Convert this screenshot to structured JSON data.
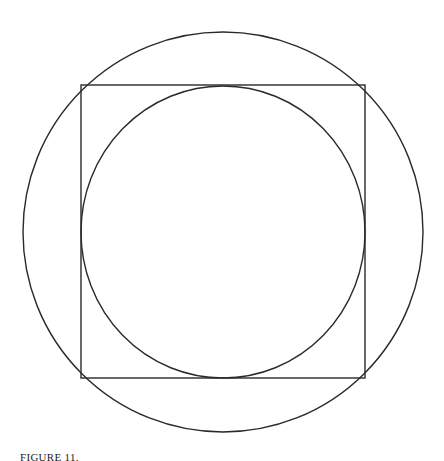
{
  "figure": {
    "type": "geometric-construction",
    "stroke_color": "#2a2a2a",
    "background": "#ffffff",
    "outer_circle": {
      "cx": 223,
      "cy": 232,
      "r": 200
    },
    "square": {
      "x": 81,
      "y": 85,
      "width": 284,
      "height": 293
    },
    "inner_circle": {
      "cx": 223,
      "cy": 232,
      "rx": 142,
      "ry": 146
    }
  },
  "caption": {
    "label": "FIGURE 11.",
    "text": "(cut off)"
  }
}
